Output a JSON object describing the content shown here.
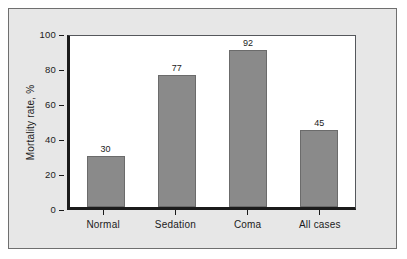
{
  "chart_data": {
    "type": "bar",
    "title": "",
    "subtitle": "",
    "xlabel": "",
    "ylabel": "Mortality rate, %",
    "categories": [
      "Normal",
      "Sedation",
      "Coma",
      "All cases"
    ],
    "values": [
      30,
      77,
      92,
      45
    ],
    "value_labels": [
      "30",
      "77",
      "92",
      "45"
    ],
    "ylim": [
      0,
      100
    ],
    "y_ticks": [
      100,
      80,
      60,
      40,
      20,
      0
    ],
    "y_tick_labels": [
      "100",
      "80",
      "60",
      "40",
      "20",
      "0"
    ],
    "grid": false,
    "legend": null,
    "legend_position": "none",
    "annotations": [],
    "series": [
      {
        "name": "Mortality rate",
        "values": [
          30,
          77,
          92,
          45
        ]
      }
    ]
  },
  "style": {
    "bar_fill": "#8a8a8a",
    "bar_stroke": "#6b6b6b",
    "axis_color": "#1b1b1b",
    "plot_background": "#ffffff",
    "figure_background": "#e7e7e7",
    "outer_background": "#ffffff",
    "frame_border": "#6f6f6f",
    "text_color": "#1b1b1b"
  }
}
